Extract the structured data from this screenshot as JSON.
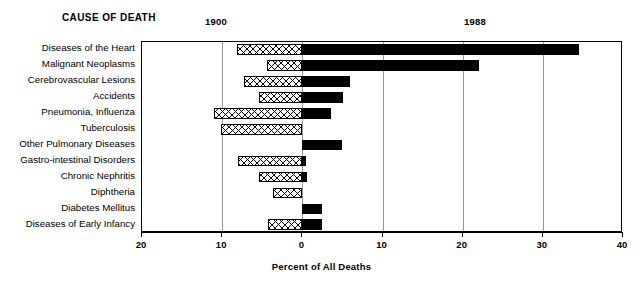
{
  "header": {
    "cause_label": "CAUSE OF DEATH",
    "series_left_label": "1900",
    "series_right_label": "1988"
  },
  "axis": {
    "title": "Percent of All Deaths",
    "ticks": [
      "20",
      "10",
      "0",
      "10",
      "20",
      "30",
      "40"
    ]
  },
  "chart_data": {
    "type": "bar",
    "orientation": "horizontal-diverging",
    "title": "CAUSE OF DEATH",
    "xlabel": "Percent of All Deaths",
    "ylabel": "",
    "xlim": [
      -20,
      40
    ],
    "xticks": [
      -20,
      -10,
      0,
      10,
      20,
      30,
      40
    ],
    "xticklabels": [
      "20",
      "10",
      "0",
      "10",
      "20",
      "30",
      "40"
    ],
    "grid": true,
    "legend": "top",
    "categories": [
      "Diseases of the Heart",
      "Malignant Neoplasms",
      "Cerebrovascular Lesions",
      "Accidents",
      "Pneumonia, Influenza",
      "Tuberculosis",
      "Other Pulmonary Diseases",
      "Gastro-intestinal Disorders",
      "Chronic Nephritis",
      "Diphtheria",
      "Diabetes Mellitus",
      "Diseases of Early Infancy"
    ],
    "series": [
      {
        "name": "1900",
        "direction": "left",
        "values": [
          8.1,
          4.4,
          7.3,
          5.4,
          11.0,
          10.1,
          0.0,
          8.0,
          5.4,
          3.6,
          0.0,
          4.3
        ]
      },
      {
        "name": "1988",
        "direction": "right",
        "values": [
          34.5,
          22.1,
          5.9,
          5.1,
          3.6,
          0.0,
          4.9,
          0.5,
          0.6,
          0.0,
          2.4,
          2.4
        ]
      }
    ]
  }
}
